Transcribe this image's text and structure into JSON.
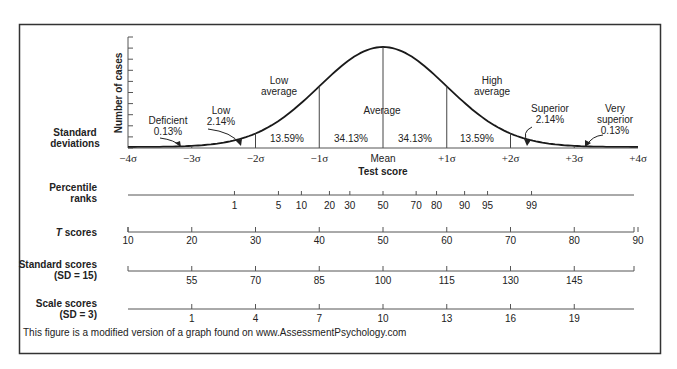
{
  "figure": {
    "caption": "This figure is a modified version of a graph found on www.AssessmentPsychology.com",
    "y_axis_label": "Number of cases",
    "x_axis_title": "Test score",
    "row_labels": {
      "standard_deviations": [
        "Standard",
        "deviations"
      ],
      "percentile_ranks": [
        "Percentile",
        "ranks"
      ],
      "t_scores": [
        "T",
        " scores"
      ],
      "standard_scores": [
        "Standard scores",
        "(SD = 15)"
      ],
      "scale_scores": [
        "Scale scores",
        "(SD = 3)"
      ]
    }
  },
  "chart_data": {
    "type": "area",
    "xlabel": "Test score",
    "ylabel": "Number of cases",
    "sigma_ticks": [
      "−4σ",
      "−3σ",
      "−2σ",
      "−1σ",
      "Mean",
      "+1σ",
      "+2σ",
      "+3σ",
      "+4σ"
    ],
    "regions": [
      {
        "label": "Deficient",
        "percent": "0.13%",
        "range": [
          -4,
          -3
        ]
      },
      {
        "label": "Low",
        "percent": "2.14%",
        "range": [
          -3,
          -2
        ]
      },
      {
        "label": "Low average",
        "percent": "13.59%",
        "range": [
          -2,
          -1
        ]
      },
      {
        "label": "Average",
        "percent": "34.13%",
        "range": [
          -1,
          0
        ]
      },
      {
        "label": "Average",
        "percent": "34.13%",
        "range": [
          0,
          1
        ]
      },
      {
        "label": "High average",
        "percent": "13.59%",
        "range": [
          1,
          2
        ]
      },
      {
        "label": "Superior",
        "percent": "2.14%",
        "range": [
          2,
          3
        ]
      },
      {
        "label": "Very superior",
        "percent": "0.13%",
        "range": [
          3,
          4
        ]
      }
    ],
    "percentile_ranks": [
      {
        "value": "1",
        "z": -2.33
      },
      {
        "value": "5",
        "z": -1.64
      },
      {
        "value": "10",
        "z": -1.28
      },
      {
        "value": "20",
        "z": -0.84
      },
      {
        "value": "30",
        "z": -0.52
      },
      {
        "value": "50",
        "z": 0
      },
      {
        "value": "70",
        "z": 0.52
      },
      {
        "value": "80",
        "z": 0.84
      },
      {
        "value": "90",
        "z": 1.28
      },
      {
        "value": "95",
        "z": 1.64
      },
      {
        "value": "99",
        "z": 2.33
      }
    ],
    "t_scores": [
      "10",
      "20",
      "30",
      "40",
      "50",
      "60",
      "70",
      "80",
      "90"
    ],
    "standard_scores": [
      "55",
      "70",
      "85",
      "100",
      "115",
      "130",
      "145"
    ],
    "scale_scores": [
      "1",
      "4",
      "7",
      "10",
      "13",
      "16",
      "19"
    ],
    "colors": {
      "line": "#1a1a1a",
      "frame": "#333333",
      "text": "#222222"
    }
  }
}
